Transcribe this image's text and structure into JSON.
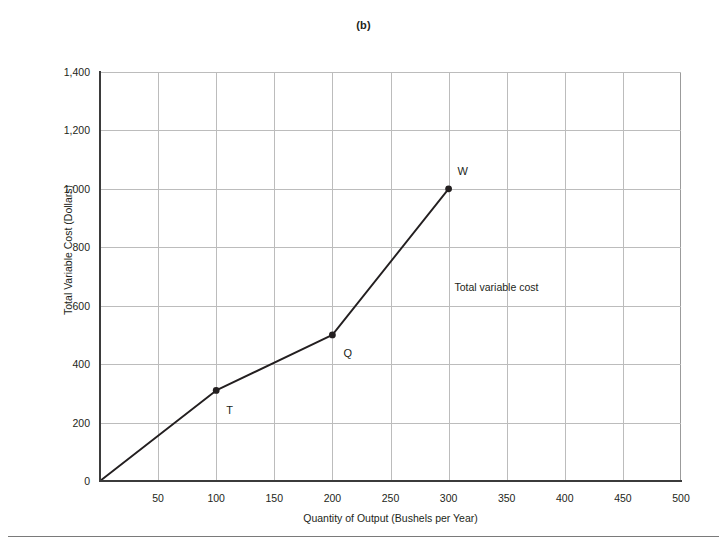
{
  "figure": {
    "panel_label": "(b)",
    "background_color": "#ffffff",
    "grid_color": "#bcbcbc",
    "axis_color": "#3b3b3b",
    "series_color": "#231f20"
  },
  "chart_data": {
    "type": "line",
    "title": "(b)",
    "xlabel": "Quantity of Output (Bushels per Year)",
    "ylabel": "Total Variable Cost (Dollars)",
    "xlim": [
      0,
      500
    ],
    "ylim": [
      0,
      1400
    ],
    "grid": true,
    "legend_position": "none",
    "x_ticks": [
      0,
      50,
      100,
      150,
      200,
      250,
      300,
      350,
      400,
      450,
      500
    ],
    "x_tick_labels": [
      "0",
      "50",
      "100",
      "150",
      "200",
      "250",
      "300",
      "350",
      "400",
      "450",
      "500"
    ],
    "y_ticks": [
      0,
      200,
      400,
      600,
      800,
      1000,
      1200,
      1400
    ],
    "y_tick_labels": [
      "0",
      "200",
      "400",
      "600",
      "800",
      "1,000",
      "1,200",
      "1,400"
    ],
    "series": [
      {
        "name": "Total variable cost",
        "x": [
          0,
          100,
          200,
          300
        ],
        "values": [
          0,
          310,
          500,
          1000
        ],
        "marked_points": [
          {
            "label": "T",
            "x": 100,
            "y": 310
          },
          {
            "label": "Q",
            "x": 200,
            "y": 500
          },
          {
            "label": "W",
            "x": 300,
            "y": 1000
          }
        ]
      }
    ],
    "annotations": [
      {
        "text": "Total variable cost",
        "x": 305,
        "y": 660
      }
    ]
  }
}
